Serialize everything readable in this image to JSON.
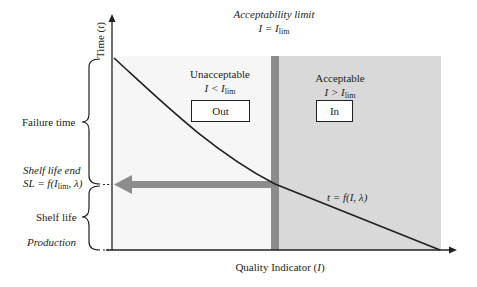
{
  "axes": {
    "y_label": "Time",
    "y_label_var": "t",
    "x_label": "Quality Indicator",
    "x_label_var": "I"
  },
  "limit": {
    "title": "Acceptability limit",
    "eq_lhs": "I = I",
    "eq_sub": "lim"
  },
  "regions": {
    "unacceptable": {
      "title": "Unacceptable",
      "cond_lhs": "I < I",
      "cond_sub": "lim",
      "box_label": "Out"
    },
    "acceptable": {
      "title": "Acceptable",
      "cond_lhs": "I > I",
      "cond_sub": "lim",
      "box_label": "In"
    }
  },
  "left_labels": {
    "failure_time": "Failure time",
    "shelf_life_end": "Shelf life end",
    "sl_formula_pre": "SL = f(I",
    "sl_formula_sub": "lim",
    "sl_formula_post": ", λ)",
    "shelf_life": "Shelf life",
    "production": "Production"
  },
  "curve_label": "t = f(I, λ)",
  "colors": {
    "acceptable_fill": "#d9d9d9",
    "unacceptable_fill": "#f6f6f6",
    "limit_bar": "#8c8c8c",
    "arrow": "#8c8c8c",
    "line": "#231f20"
  }
}
